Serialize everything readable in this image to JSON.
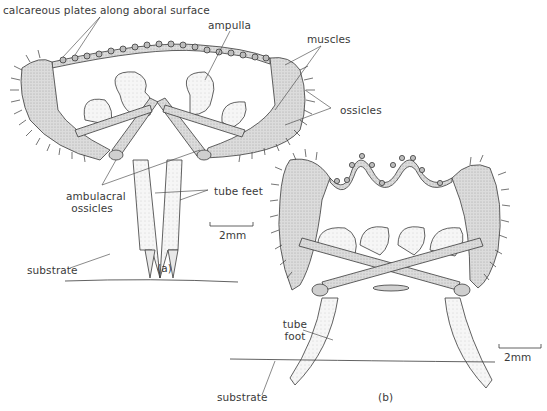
{
  "figure": {
    "panels": [
      {
        "id": "a",
        "caption": "(a)",
        "scale_bar": "2mm",
        "labels": {
          "calcareous_plates": "calcareous plates along aboral surface",
          "ampulla": "ampulla",
          "muscles": "muscles",
          "ossicles": "ossicles",
          "ambulacral_ossicles_line1": "ambulacral",
          "ambulacral_ossicles_line2": "ossicles",
          "tube_feet": "tube feet",
          "substrate": "substrate"
        }
      },
      {
        "id": "b",
        "caption": "(b)",
        "scale_bar": "2mm",
        "labels": {
          "tube_foot_line1": "tube",
          "tube_foot_line2": "foot",
          "substrate": "substrate"
        }
      }
    ],
    "colors": {
      "ink": "#3a3a3a",
      "fill_grey": "#d9d9d9",
      "fill_light": "#efefef"
    }
  }
}
